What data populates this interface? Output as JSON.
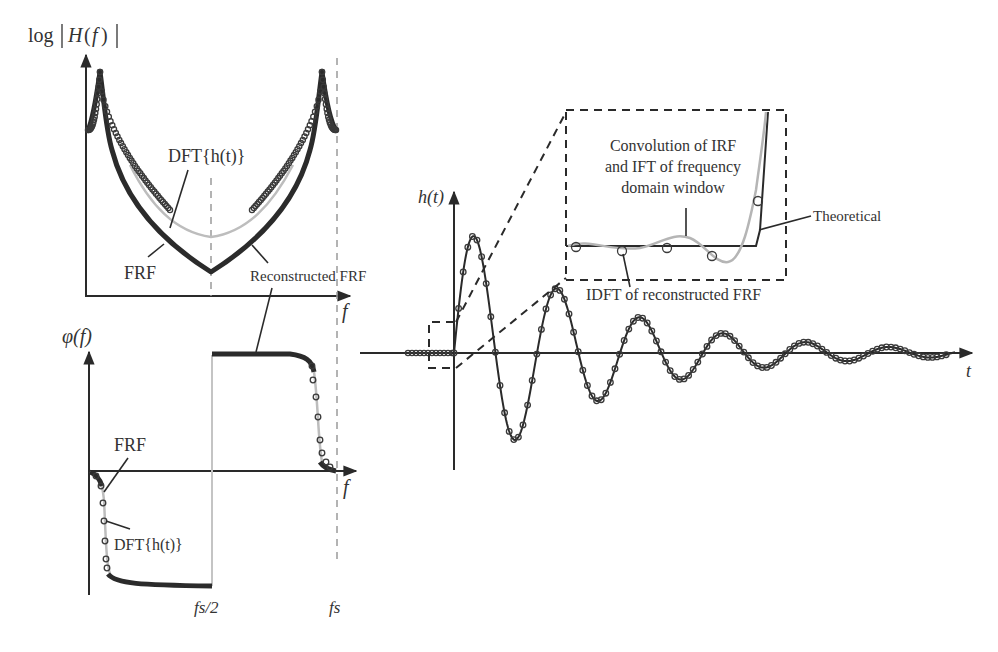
{
  "figure": {
    "magnitude_panel": {
      "ylabel": "log|H(f)|",
      "ylabel_parts": {
        "log": "log",
        "H": "H",
        "f_open": "(",
        "f": "f",
        "f_close": ")"
      },
      "xlabel": "f",
      "annotations": {
        "dft": "DFT{h(t)}",
        "frf": "FRF",
        "reconstructed": "Reconstructed FRF"
      }
    },
    "phase_panel": {
      "ylabel": "φ(f)",
      "xlabel": "f",
      "annotations": {
        "frf": "FRF",
        "dft": "DFT{h(t)}"
      },
      "ticks": {
        "half_fs": "fs/2",
        "fs": "fs"
      }
    },
    "time_panel": {
      "ylabel": "h(t)",
      "xlabel": "t",
      "annotations": {
        "theoretical": "Theoretical",
        "idft": "IDFT of reconstructed FRF",
        "convolution_line1": "Convolution of IRF",
        "convolution_line2": "and IFT of frequency",
        "convolution_line3": "domain window"
      }
    },
    "colors": {
      "frf": "#2b2b2b",
      "dft": "#bdbdbd",
      "axis": "#2a2a2a",
      "guide": "#9a9a9a"
    }
  }
}
